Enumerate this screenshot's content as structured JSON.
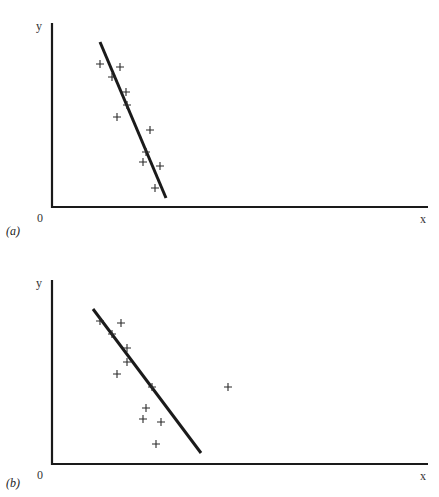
{
  "chart_data": [
    {
      "type": "scatter",
      "panel_label": "(a)",
      "xlabel": "x",
      "ylabel": "y",
      "origin_label": "0",
      "title": "",
      "grid": false,
      "legend": null,
      "axis_px": {
        "x0": 52,
        "y0": 207,
        "x_end": 428,
        "y_top": 23
      },
      "points_px": [
        [
          100,
          64
        ],
        [
          120,
          67
        ],
        [
          112,
          77
        ],
        [
          126,
          92
        ],
        [
          127,
          105
        ],
        [
          117,
          117
        ],
        [
          150,
          130
        ],
        [
          146,
          152
        ],
        [
          143,
          162
        ],
        [
          160,
          166
        ],
        [
          155,
          188
        ]
      ],
      "fit_line_px": [
        [
          100,
          42
        ],
        [
          166,
          198
        ]
      ],
      "annotation": "Least-squares regression line fitted to 11 points with strong negative slope"
    },
    {
      "type": "scatter",
      "panel_label": "(b)",
      "xlabel": "x",
      "ylabel": "y",
      "origin_label": "0",
      "title": "",
      "grid": false,
      "legend": null,
      "axis_px": {
        "x0": 52,
        "y0": 464,
        "x_end": 428,
        "y_top": 280
      },
      "points_px": [
        [
          100,
          321
        ],
        [
          121,
          323
        ],
        [
          112,
          334
        ],
        [
          127,
          348
        ],
        [
          127,
          362
        ],
        [
          117,
          374
        ],
        [
          152,
          387
        ],
        [
          146,
          408
        ],
        [
          143,
          419
        ],
        [
          161,
          422
        ],
        [
          156,
          444
        ]
      ],
      "outlier_px": [
        228,
        387
      ],
      "fit_line_px": [
        [
          93,
          309
        ],
        [
          201,
          453
        ]
      ],
      "annotation": "Same 11 points plus one outlier on the right; regression line is pulled to a shallower slope"
    }
  ]
}
